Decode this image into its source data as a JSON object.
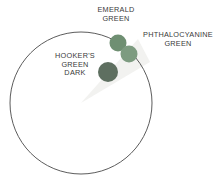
{
  "diagram": {
    "type": "color-wheel-segment",
    "background_color": "#ffffff",
    "wheel": {
      "name": "color-wheel",
      "outline_color": "#4a4a4a",
      "fill_color": "#ffffff",
      "center_x": 81,
      "center_y": 103,
      "radius": 71
    },
    "wedge": {
      "name": "green-hue-wedge",
      "fill_color": "#f2f2f0",
      "apex_x": 81,
      "apex_y": 103
    },
    "swatches": [
      {
        "id": "emerald-green",
        "label": "EMERALD GREEN",
        "color": "#6f8f72",
        "cx": 118,
        "cy": 43,
        "r": 8.5
      },
      {
        "id": "phthalocyanine-green",
        "label": "PHTHALOCYANINE GREEN",
        "color": "#7d9b80",
        "cx": 129,
        "cy": 54,
        "r": 8.5
      },
      {
        "id": "hookers-green-dark",
        "label": "HOOKER'S GREEN DARK",
        "color": "#5e6f60",
        "cx": 108,
        "cy": 72,
        "r": 10
      }
    ],
    "labels": {
      "emerald": {
        "name": "emerald-green-label",
        "line1": "EMERALD",
        "line2": "GREEN"
      },
      "phthalocyanine": {
        "name": "phthalocyanine-green-label",
        "line1": "PHTHALOCYANINE",
        "line2": "GREEN"
      },
      "hookers": {
        "name": "hookers-green-dark-label",
        "line1": "HOOKER'S",
        "line2": "GREEN",
        "line3": "DARK"
      }
    },
    "text_color": "#3a3a3a"
  }
}
